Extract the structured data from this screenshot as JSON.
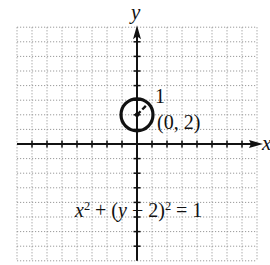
{
  "figure": {
    "axes": {
      "x_label": "x",
      "y_label": "y",
      "x_range": [
        -8,
        8
      ],
      "y_range": [
        -8,
        8
      ],
      "unit_px_x": 15,
      "unit_px_y": 14.6,
      "origin_px": [
        137,
        144
      ],
      "grid": "dotted",
      "tick_every": 1
    },
    "circle": {
      "center": [
        0,
        2
      ],
      "radius": 1,
      "stroke_color": "#111111"
    },
    "annotations": {
      "radius_label": "1",
      "center_label": "(0, 2)",
      "equation": {
        "x_var": "x",
        "x_exp": "2",
        "plus": " + (",
        "y_var": "y",
        "minus": " − 2)",
        "y_exp": "2",
        "rhs": " = 1"
      }
    },
    "colors": {
      "grid": "#9a9a9a",
      "axis": "#111111",
      "background": "#ffffff"
    }
  }
}
